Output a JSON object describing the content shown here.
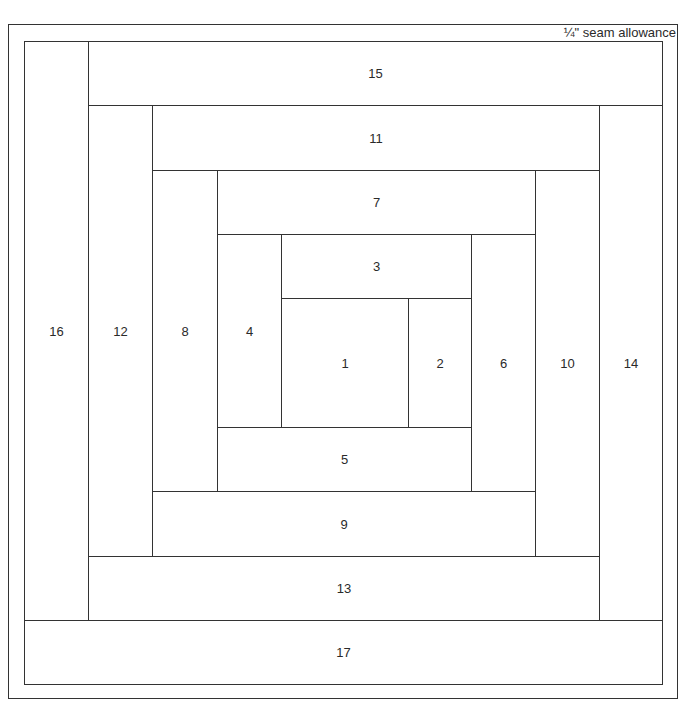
{
  "diagram": {
    "type": "log-cabin-quilt-block",
    "seam_note": "¼\" seam allowance",
    "pieces": [
      {
        "id": "1",
        "label": "1",
        "x": 281,
        "y": 298,
        "w": 128,
        "h": 130
      },
      {
        "id": "2",
        "label": "2",
        "x": 408,
        "y": 298,
        "w": 64,
        "h": 130
      },
      {
        "id": "3",
        "label": "3",
        "x": 281,
        "y": 234,
        "w": 191,
        "h": 65
      },
      {
        "id": "4",
        "label": "4",
        "x": 217,
        "y": 234,
        "w": 65,
        "h": 194
      },
      {
        "id": "5",
        "label": "5",
        "x": 217,
        "y": 427,
        "w": 255,
        "h": 65
      },
      {
        "id": "6",
        "label": "6",
        "x": 471,
        "y": 234,
        "w": 65,
        "h": 258
      },
      {
        "id": "7",
        "label": "7",
        "x": 217,
        "y": 170,
        "w": 319,
        "h": 65
      },
      {
        "id": "8",
        "label": "8",
        "x": 152,
        "y": 170,
        "w": 66,
        "h": 322
      },
      {
        "id": "9",
        "label": "9",
        "x": 152,
        "y": 491,
        "w": 384,
        "h": 66
      },
      {
        "id": "10",
        "label": "10",
        "x": 535,
        "y": 170,
        "w": 65,
        "h": 387
      },
      {
        "id": "11",
        "label": "11",
        "x": 152,
        "y": 105,
        "w": 448,
        "h": 66
      },
      {
        "id": "12",
        "label": "12",
        "x": 88,
        "y": 105,
        "w": 65,
        "h": 452
      },
      {
        "id": "13",
        "label": "13",
        "x": 88,
        "y": 556,
        "w": 512,
        "h": 65
      },
      {
        "id": "14",
        "label": "14",
        "x": 599,
        "y": 105,
        "w": 64,
        "h": 516
      },
      {
        "id": "15",
        "label": "15",
        "x": 88,
        "y": 41,
        "w": 575,
        "h": 65
      },
      {
        "id": "16",
        "label": "16",
        "x": 24,
        "y": 41,
        "w": 65,
        "h": 580
      },
      {
        "id": "17",
        "label": "17",
        "x": 24,
        "y": 620,
        "w": 639,
        "h": 65
      }
    ]
  },
  "colors": {
    "line": "#333333",
    "text": "#2a2a2a",
    "background": "#ffffff"
  }
}
